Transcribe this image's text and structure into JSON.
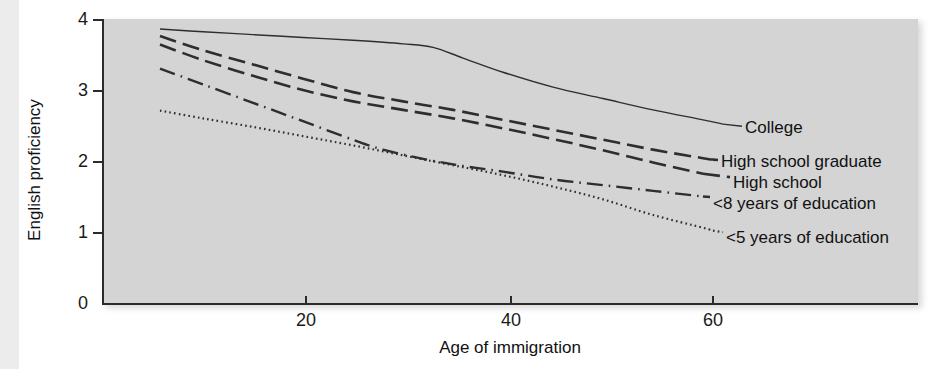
{
  "figure": {
    "background_color": "#ffffff",
    "plot_background_color": "#d4d4d4",
    "line_color": "#2e2e2e"
  },
  "axis": {
    "y_title": "English proficiency",
    "x_title": "Age of immigration",
    "y_ticks": [
      "0",
      "1",
      "2",
      "3",
      "4"
    ],
    "x_ticks": [
      "20",
      "40",
      "60"
    ]
  },
  "labels": {
    "college": "College",
    "high_school_graduate": "High school graduate",
    "high_school": "High school",
    "under_8_years": "<8 years of education",
    "under_5_years": "<5 years of education"
  },
  "chart_data": {
    "type": "line",
    "title": "",
    "xlabel": "Age of immigration",
    "ylabel": "English proficiency",
    "xlim": [
      0,
      81.5
    ],
    "ylim": [
      0,
      4
    ],
    "xticks": [
      20,
      40,
      60
    ],
    "yticks": [
      0,
      1,
      2,
      3,
      4
    ],
    "grid": false,
    "legend": "inline-right-end-of-line",
    "series": [
      {
        "name": "College",
        "linestyle": "solid",
        "x": [
          5.7,
          10,
          15,
          20,
          25,
          30,
          33,
          36,
          40,
          45,
          50,
          55,
          60,
          62
        ],
        "y": [
          3.86,
          3.82,
          3.78,
          3.74,
          3.7,
          3.65,
          3.6,
          3.45,
          3.25,
          3.04,
          2.88,
          2.72,
          2.58,
          2.52
        ]
      },
      {
        "name": "High school graduate",
        "linestyle": "dashed",
        "x": [
          5.7,
          10,
          15,
          20,
          25,
          30,
          35,
          40,
          45,
          50,
          55,
          60,
          61
        ],
        "y": [
          3.76,
          3.56,
          3.36,
          3.16,
          2.97,
          2.84,
          2.72,
          2.58,
          2.44,
          2.3,
          2.16,
          2.04,
          2.02
        ]
      },
      {
        "name": "High school",
        "linestyle": "dashed",
        "x": [
          5.7,
          10,
          15,
          20,
          25,
          30,
          35,
          40,
          45,
          50,
          55,
          60
        ],
        "y": [
          3.64,
          3.42,
          3.2,
          3.0,
          2.84,
          2.72,
          2.6,
          2.46,
          2.31,
          2.15,
          1.98,
          1.82
        ]
      },
      {
        "name": "<8 years of education",
        "linestyle": "dashdot",
        "x": [
          5.7,
          10,
          15,
          20,
          25,
          28,
          32,
          36,
          40,
          45,
          50,
          55,
          60
        ],
        "y": [
          3.3,
          3.08,
          2.82,
          2.56,
          2.3,
          2.16,
          2.03,
          1.93,
          1.85,
          1.74,
          1.66,
          1.58,
          1.5
        ]
      },
      {
        "name": "<5 years of education",
        "linestyle": "dotted",
        "x": [
          5.7,
          10,
          15,
          20,
          25,
          30,
          35,
          40,
          45,
          50,
          55,
          60,
          61
        ],
        "y": [
          2.71,
          2.6,
          2.48,
          2.35,
          2.22,
          2.08,
          1.94,
          1.8,
          1.64,
          1.46,
          1.24,
          1.06,
          1.02
        ]
      }
    ]
  }
}
